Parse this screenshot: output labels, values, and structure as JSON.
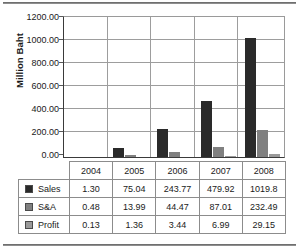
{
  "chart_data": {
    "type": "bar",
    "title": "",
    "xlabel": "",
    "ylabel": "Million Baht",
    "categories": [
      "2004",
      "2005",
      "2006",
      "2007",
      "2008"
    ],
    "series": [
      {
        "name": "Sales",
        "values": [
          1.3,
          75.04,
          243.77,
          479.92,
          1019.8
        ],
        "color": "#2a2a2a"
      },
      {
        "name": "S&A",
        "values": [
          0.48,
          13.99,
          44.47,
          87.01,
          232.49
        ],
        "color": "#808080"
      },
      {
        "name": "Profit",
        "values": [
          0.13,
          1.36,
          3.44,
          6.99,
          29.15
        ],
        "color": "#9a9a9a"
      }
    ],
    "ylim": [
      0,
      1200
    ],
    "ytick_step": 200,
    "ytick_labels": [
      "1200.00",
      "1000.00",
      "800.00",
      "600.00",
      "400.00",
      "200.00",
      "0.00"
    ],
    "grid": true,
    "legend_position": "data-table-left",
    "data_table": {
      "header": [
        "",
        "2004",
        "2005",
        "2006",
        "2007",
        "2008"
      ],
      "rows": [
        {
          "label": "Sales",
          "swatch": "sales-swatch-icon",
          "cells": [
            "1.30",
            "75.04",
            "243.77",
            "479.92",
            "1019.8"
          ]
        },
        {
          "label": "S&A",
          "swatch": "sa-swatch-icon",
          "cells": [
            "0.48",
            "13.99",
            "44.47",
            "87.01",
            "232.49"
          ]
        },
        {
          "label": "Profit",
          "swatch": "profit-swatch-icon",
          "cells": [
            "0.13",
            "1.36",
            "3.44",
            "6.99",
            "29.15"
          ]
        }
      ]
    }
  }
}
